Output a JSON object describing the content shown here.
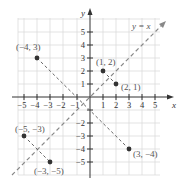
{
  "diagram": {
    "axes": {
      "x_label": "x",
      "y_label": "y"
    },
    "x_ticks": [
      "−5",
      "−4",
      "−3",
      "−2",
      "−1",
      "1",
      "2",
      "3",
      "4",
      "5"
    ],
    "y_ticks": [
      "5",
      "4",
      "3",
      "2",
      "1",
      "−2",
      "−3",
      "−4",
      "−5"
    ],
    "line_label": "y = x",
    "points": [
      {
        "label": "(−4, 3)",
        "x": -4,
        "y": 3
      },
      {
        "label": "(1, 2)",
        "x": 1,
        "y": 2
      },
      {
        "label": "(2, 1)",
        "x": 2,
        "y": 1
      },
      {
        "label": "(−5, −3)",
        "x": -5,
        "y": -3
      },
      {
        "label": "(−3, −5)",
        "x": -3,
        "y": -5
      },
      {
        "label": "(3, −4)",
        "x": 3,
        "y": -4
      }
    ],
    "colors": {
      "grid": "#dcdcdc",
      "axis": "#333333",
      "dashed": "#888888",
      "point": "#333333"
    }
  }
}
